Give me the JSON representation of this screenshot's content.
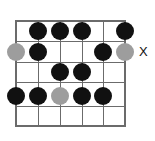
{
  "diagram": {
    "type": "guitar-fretboard-scale-diagram",
    "grid": {
      "strings": 6,
      "frets": 5,
      "string_x": [
        16,
        38,
        60,
        82,
        103,
        125
      ],
      "fret_y": [
        21,
        41,
        62,
        82,
        106,
        126
      ],
      "line_color": "#6b6b6b",
      "background": "#ffffff"
    },
    "dot_colors": {
      "filled": "#111111",
      "muted": "#9d9d9d"
    },
    "dot_radius": 9,
    "dots": [
      {
        "id": "dot-r1-s2",
        "string": 2,
        "fret_row": 1,
        "x": 38,
        "y": 31,
        "color": "filled"
      },
      {
        "id": "dot-r1-s3",
        "string": 3,
        "fret_row": 1,
        "x": 60,
        "y": 31,
        "color": "filled"
      },
      {
        "id": "dot-r1-s4",
        "string": 4,
        "fret_row": 1,
        "x": 82,
        "y": 31,
        "color": "filled"
      },
      {
        "id": "dot-r1-s6",
        "string": 6,
        "fret_row": 1,
        "x": 125,
        "y": 31,
        "color": "filled"
      },
      {
        "id": "dot-r2-s1",
        "string": 1,
        "fret_row": 2,
        "x": 16,
        "y": 52,
        "color": "muted"
      },
      {
        "id": "dot-r2-s2",
        "string": 2,
        "fret_row": 2,
        "x": 38,
        "y": 52,
        "color": "filled"
      },
      {
        "id": "dot-r2-s5",
        "string": 5,
        "fret_row": 2,
        "x": 103,
        "y": 52,
        "color": "filled"
      },
      {
        "id": "dot-r2-s6",
        "string": 6,
        "fret_row": 2,
        "x": 125,
        "y": 52,
        "color": "muted"
      },
      {
        "id": "dot-r3-s3",
        "string": 3,
        "fret_row": 3,
        "x": 60,
        "y": 72,
        "color": "filled"
      },
      {
        "id": "dot-r3-s4",
        "string": 4,
        "fret_row": 3,
        "x": 82,
        "y": 72,
        "color": "filled"
      },
      {
        "id": "dot-r4-s1",
        "string": 1,
        "fret_row": 4,
        "x": 16,
        "y": 96,
        "color": "filled"
      },
      {
        "id": "dot-r4-s2",
        "string": 2,
        "fret_row": 4,
        "x": 38,
        "y": 96,
        "color": "filled"
      },
      {
        "id": "dot-r4-s3",
        "string": 3,
        "fret_row": 4,
        "x": 60,
        "y": 96,
        "color": "muted"
      },
      {
        "id": "dot-r4-s4",
        "string": 4,
        "fret_row": 4,
        "x": 82,
        "y": 96,
        "color": "filled"
      },
      {
        "id": "dot-r4-s5",
        "string": 5,
        "fret_row": 4,
        "x": 103,
        "y": 96,
        "color": "filled"
      }
    ],
    "labels": [
      {
        "id": "label-x",
        "text": "X",
        "x": 139,
        "y": 52,
        "color": "#111111"
      }
    ]
  }
}
